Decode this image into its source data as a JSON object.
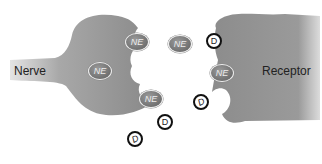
{
  "diagram": {
    "labels": {
      "nerve": "Nerve",
      "receptor": "Receptor"
    },
    "molecules": {
      "ne": [
        {
          "text": "NE",
          "x": 125,
          "y": 33
        },
        {
          "text": "NE",
          "x": 88,
          "y": 62
        },
        {
          "text": "NE",
          "x": 139,
          "y": 90
        },
        {
          "text": "NE",
          "x": 168,
          "y": 35
        },
        {
          "text": "NE",
          "x": 210,
          "y": 64
        }
      ],
      "d": [
        {
          "text": "D",
          "x": 206,
          "y": 33,
          "tilted": false
        },
        {
          "text": "D",
          "x": 193,
          "y": 94,
          "tilted": true
        },
        {
          "text": "D",
          "x": 157,
          "y": 114,
          "tilted": false
        },
        {
          "text": "D",
          "x": 127,
          "y": 131,
          "tilted": true
        }
      ]
    },
    "colors": {
      "cell_gray": "#8f8f8f",
      "background": "#ffffff",
      "d_ring": "#111111"
    }
  }
}
